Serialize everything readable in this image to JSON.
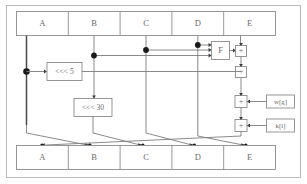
{
  "diagram": {
    "colors": {
      "frame": "#b9b9b9",
      "box_stroke": "#8c8c8c",
      "wire": "#7d7d7d",
      "wire_emphasis": "#4a4a4a",
      "junction": "#1a1a1a",
      "text": "#6b6b6b",
      "background": "#ffffff"
    },
    "input_register": {
      "name": "input-register",
      "cells": [
        {
          "label": "A"
        },
        {
          "label": "B"
        },
        {
          "label": "C"
        },
        {
          "label": "D"
        },
        {
          "label": "E"
        }
      ]
    },
    "output_register": {
      "name": "output-register",
      "cells": [
        {
          "label": "A"
        },
        {
          "label": "B"
        },
        {
          "label": "C"
        },
        {
          "label": "D"
        },
        {
          "label": "E"
        }
      ]
    },
    "units": {
      "rotate_left_5": {
        "label": "<<< 5"
      },
      "rotate_left_30": {
        "label": "<<< 30"
      },
      "nonlinear_function": {
        "label": "F"
      }
    },
    "adders": [
      {
        "id": "adder-f",
        "label": "+"
      },
      {
        "id": "adder-rot5",
        "label": "+"
      },
      {
        "id": "adder-w",
        "label": "+"
      },
      {
        "id": "adder-k",
        "label": "+"
      }
    ],
    "sources": {
      "message_word": {
        "label": "w[g]"
      },
      "round_constant": {
        "label": "k[i]"
      }
    }
  }
}
